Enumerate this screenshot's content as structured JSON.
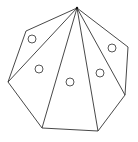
{
  "diagram": {
    "polygon_sides": 7,
    "triangle_count": 5,
    "apex_vertex": "top",
    "stroke_color": "#333333",
    "background_color": "#ffffff",
    "marker_shape": "circle",
    "labels": []
  }
}
